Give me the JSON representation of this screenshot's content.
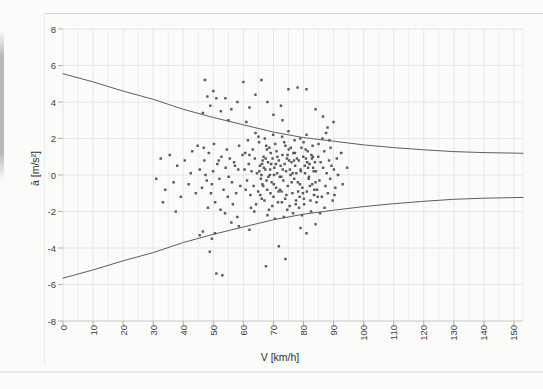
{
  "chart_data": {
    "type": "scatter",
    "title": "",
    "xlabel": "V [km/h]",
    "ylabel": "ā [m/s²]",
    "xlim": [
      0,
      153
    ],
    "ylim": [
      -8,
      8
    ],
    "x_ticks": [
      0,
      10,
      20,
      30,
      40,
      50,
      60,
      70,
      80,
      90,
      100,
      110,
      120,
      130,
      140,
      150
    ],
    "y_ticks": [
      8,
      6,
      4,
      2,
      0,
      -2,
      -4,
      -6,
      -8
    ],
    "x_minor_grid_step": 5,
    "y_grid_step": 2,
    "grid": true,
    "legend": false,
    "colors": {
      "point": "#4a4a4a",
      "curve": "#5e5e5e",
      "grid": "#ededeb",
      "grid_major": "#e6e6e4",
      "axis_line": "#c6c6c3",
      "tick_mark": "#b3b3b0",
      "tick_text": "#3f3f3f"
    },
    "series": [
      {
        "name": "measured accelerations",
        "kind": "points",
        "points": [
          [
            61.2,
            -0.3
          ],
          [
            61.8,
            0.6
          ],
          [
            62.3,
            -1.1
          ],
          [
            62.7,
            0.2
          ],
          [
            63.1,
            1.4
          ],
          [
            63.4,
            -0.6
          ],
          [
            63.8,
            0.9
          ],
          [
            64.2,
            -1.6
          ],
          [
            64.5,
            0.1
          ],
          [
            64.9,
            -0.9
          ],
          [
            65.2,
            1.8
          ],
          [
            65.5,
            0.5
          ],
          [
            65.8,
            -0.2
          ],
          [
            66.1,
            -1.3
          ],
          [
            66.4,
            0.8
          ],
          [
            60.4,
            0.3
          ],
          [
            60.8,
            -0.8
          ],
          [
            62.0,
            1.1
          ],
          [
            63.6,
            -2.0
          ],
          [
            65.0,
            2.1
          ],
          [
            61.5,
            1.9
          ],
          [
            64.0,
            2.3
          ],
          [
            62.5,
            -1.8
          ],
          [
            60.6,
            1.2
          ],
          [
            66.0,
            0.0
          ],
          [
            66.3,
            -0.5
          ],
          [
            66.7,
            1.0
          ],
          [
            67.0,
            -1.4
          ],
          [
            67.3,
            0.3
          ],
          [
            67.6,
            1.6
          ],
          [
            67.9,
            -0.8
          ],
          [
            68.2,
            0.7
          ],
          [
            68.5,
            -1.9
          ],
          [
            68.8,
            0.0
          ],
          [
            69.1,
            1.2
          ],
          [
            69.4,
            -0.4
          ],
          [
            69.7,
            0.9
          ],
          [
            70.0,
            -1.2
          ],
          [
            70.3,
            0.4
          ],
          [
            70.6,
            1.7
          ],
          [
            70.9,
            -0.7
          ],
          [
            71.2,
            0.1
          ],
          [
            71.5,
            -1.5
          ],
          [
            71.8,
            0.8
          ],
          [
            72.1,
            -0.1
          ],
          [
            67.1,
            2.0
          ],
          [
            69.9,
            2.2
          ],
          [
            68.0,
            -2.2
          ],
          [
            70.5,
            -2.4
          ],
          [
            66.8,
            0.4
          ],
          [
            69.0,
            -1.0
          ],
          [
            71.0,
            1.3
          ],
          [
            67.7,
            -0.3
          ],
          [
            70.8,
            0.6
          ],
          [
            68.6,
            1.5
          ],
          [
            72.4,
            0.5
          ],
          [
            72.7,
            -0.9
          ],
          [
            73.0,
            1.1
          ],
          [
            73.3,
            -0.3
          ],
          [
            73.6,
            1.8
          ],
          [
            73.9,
            -1.3
          ],
          [
            74.2,
            0.2
          ],
          [
            74.5,
            0.9
          ],
          [
            74.8,
            -0.6
          ],
          [
            75.1,
            1.4
          ],
          [
            75.4,
            -1.7
          ],
          [
            75.7,
            0.0
          ],
          [
            76.0,
            0.7
          ],
          [
            76.3,
            -1.0
          ],
          [
            76.6,
            1.2
          ],
          [
            76.9,
            -0.2
          ],
          [
            77.2,
            0.5
          ],
          [
            77.5,
            -1.4
          ],
          [
            77.8,
            0.9
          ],
          [
            72.9,
            2.1
          ],
          [
            75.0,
            2.4
          ],
          [
            76.5,
            -2.1
          ],
          [
            73.5,
            -2.3
          ],
          [
            74.0,
            1.6
          ],
          [
            77.0,
            1.9
          ],
          [
            75.5,
            0.3
          ],
          [
            72.6,
            -0.1
          ],
          [
            76.8,
            0.8
          ],
          [
            74.6,
            -1.9
          ],
          [
            77.6,
            0.1
          ],
          [
            78.1,
            -0.4
          ],
          [
            78.4,
            0.8
          ],
          [
            78.7,
            -1.2
          ],
          [
            79.0,
            0.3
          ],
          [
            79.3,
            1.5
          ],
          [
            79.6,
            -0.7
          ],
          [
            79.9,
            1.0
          ],
          [
            80.2,
            -1.6
          ],
          [
            80.5,
            0.1
          ],
          [
            80.8,
            0.9
          ],
          [
            81.1,
            -0.9
          ],
          [
            81.4,
            1.3
          ],
          [
            81.7,
            -0.2
          ],
          [
            82.0,
            0.6
          ],
          [
            82.3,
            -1.4
          ],
          [
            82.6,
            1.1
          ],
          [
            82.9,
            -0.5
          ],
          [
            83.2,
            0.4
          ],
          [
            83.5,
            -1.1
          ],
          [
            83.8,
            0.7
          ],
          [
            78.9,
            2.0
          ],
          [
            81.0,
            2.2
          ],
          [
            79.5,
            -2.2
          ],
          [
            82.5,
            -2.0
          ],
          [
            80.0,
            1.8
          ],
          [
            83.0,
            1.6
          ],
          [
            78.5,
            -1.8
          ],
          [
            81.8,
            -0.1
          ],
          [
            80.4,
            0.5
          ],
          [
            83.6,
            -0.8
          ],
          [
            84.1,
            0.2
          ],
          [
            84.5,
            -0.8
          ],
          [
            84.9,
            1.0
          ],
          [
            85.3,
            -0.3
          ],
          [
            85.7,
            0.7
          ],
          [
            86.1,
            -1.2
          ],
          [
            86.5,
            0.4
          ],
          [
            86.9,
            1.3
          ],
          [
            87.3,
            -0.6
          ],
          [
            87.7,
            0.1
          ],
          [
            88.1,
            -1.0
          ],
          [
            88.5,
            0.8
          ],
          [
            88.9,
            -0.2
          ],
          [
            89.3,
            0.5
          ],
          [
            89.7,
            -1.4
          ],
          [
            90.1,
            0.3
          ],
          [
            90.6,
            -0.7
          ],
          [
            91.1,
            0.9
          ],
          [
            85.0,
            1.7
          ],
          [
            87.0,
            -1.8
          ],
          [
            89.0,
            1.5
          ],
          [
            90.3,
            -1.1
          ],
          [
            86.3,
            2.0
          ],
          [
            88.6,
            1.9
          ],
          [
            84.3,
            -1.5
          ],
          [
            91.5,
            0.0
          ],
          [
            85.5,
            -2.1
          ],
          [
            87.5,
            2.3
          ],
          [
            65.3,
            0.2
          ],
          [
            66.6,
            -0.6
          ],
          [
            67.4,
            0.9
          ],
          [
            68.3,
            -0.1
          ],
          [
            69.2,
            0.6
          ],
          [
            70.1,
            -0.5
          ],
          [
            71.3,
            1.0
          ],
          [
            72.2,
            -0.8
          ],
          [
            73.1,
            0.3
          ],
          [
            74.3,
            -1.1
          ],
          [
            75.2,
            0.8
          ],
          [
            76.1,
            -0.4
          ],
          [
            77.1,
            1.2
          ],
          [
            78.2,
            -0.9
          ],
          [
            79.1,
            0.2
          ],
          [
            80.1,
            -1.3
          ],
          [
            81.2,
            0.7
          ],
          [
            82.1,
            -0.6
          ],
          [
            83.1,
            1.0
          ],
          [
            84.0,
            -0.4
          ],
          [
            65.6,
            -1.1
          ],
          [
            67.8,
            1.4
          ],
          [
            70.2,
            0.0
          ],
          [
            72.8,
            -1.5
          ],
          [
            75.8,
            1.5
          ],
          [
            78.8,
            -0.5
          ],
          [
            81.5,
            0.4
          ],
          [
            84.7,
            -1.2
          ],
          [
            68.9,
            0.3
          ],
          [
            71.7,
            -0.9
          ],
          [
            74.7,
            1.1
          ],
          [
            77.4,
            -1.6
          ],
          [
            80.7,
            1.4
          ],
          [
            83.4,
            0.2
          ],
          [
            66.2,
            0.6
          ],
          [
            69.6,
            -1.7
          ],
          [
            73.7,
            0.6
          ],
          [
            76.4,
            0.1
          ],
          [
            79.8,
            -1.0
          ],
          [
            82.8,
            0.9
          ],
          [
            45.5,
            0.3
          ],
          [
            46.2,
            -0.7
          ],
          [
            47.0,
            0.8
          ],
          [
            47.8,
            -0.3
          ],
          [
            48.5,
            1.2
          ],
          [
            49.2,
            -1.0
          ],
          [
            49.9,
            0.2
          ],
          [
            50.6,
            -1.5
          ],
          [
            51.3,
            0.6
          ],
          [
            52.0,
            -0.2
          ],
          [
            52.7,
            1.0
          ],
          [
            53.4,
            -0.8
          ],
          [
            54.1,
            0.4
          ],
          [
            54.8,
            -1.2
          ],
          [
            55.5,
            0.9
          ],
          [
            56.2,
            -0.4
          ],
          [
            56.9,
            0.7
          ],
          [
            57.6,
            -1.0
          ],
          [
            58.3,
            0.3
          ],
          [
            59.0,
            -0.6
          ],
          [
            59.7,
            1.1
          ],
          [
            46.8,
            1.5
          ],
          [
            48.2,
            -1.8
          ],
          [
            50.2,
            1.7
          ],
          [
            52.4,
            -1.9
          ],
          [
            54.5,
            1.4
          ],
          [
            56.5,
            -1.6
          ],
          [
            58.6,
            1.6
          ],
          [
            47.4,
            0.0
          ],
          [
            51.8,
            0.8
          ],
          [
            55.1,
            -0.1
          ],
          [
            57.2,
            0.5
          ],
          [
            49.5,
            -0.5
          ],
          [
            53.9,
            -2.1
          ],
          [
            58.0,
            -2.3
          ],
          [
            31.0,
            -0.2
          ],
          [
            32.5,
            0.9
          ],
          [
            34.0,
            -0.8
          ],
          [
            35.5,
            1.1
          ],
          [
            36.8,
            -0.4
          ],
          [
            38.0,
            0.5
          ],
          [
            39.2,
            -1.2
          ],
          [
            40.5,
            0.8
          ],
          [
            41.8,
            -0.5
          ],
          [
            43.0,
            1.3
          ],
          [
            44.2,
            -1.0
          ],
          [
            33.2,
            -1.5
          ],
          [
            37.5,
            -2.0
          ],
          [
            42.5,
            0.1
          ],
          [
            44.8,
            1.6
          ],
          [
            46.5,
            3.4
          ],
          [
            47.2,
            5.2
          ],
          [
            48.0,
            4.3
          ],
          [
            49.0,
            3.8
          ],
          [
            50.0,
            4.6
          ],
          [
            51.0,
            4.2
          ],
          [
            52.5,
            3.5
          ],
          [
            54.0,
            4.2
          ],
          [
            55.0,
            3.0
          ],
          [
            56.0,
            3.6
          ],
          [
            58.0,
            4.0
          ],
          [
            60.0,
            5.1
          ],
          [
            62.0,
            3.7
          ],
          [
            64.0,
            4.4
          ],
          [
            66.0,
            5.2
          ],
          [
            68.0,
            4.0
          ],
          [
            70.0,
            3.3
          ],
          [
            72.5,
            3.8
          ],
          [
            75.0,
            4.7
          ],
          [
            78.0,
            4.8
          ],
          [
            81.0,
            4.7
          ],
          [
            86.5,
            3.2
          ],
          [
            90.0,
            2.9
          ],
          [
            84.0,
            3.6
          ],
          [
            61.0,
            2.9
          ],
          [
            73.0,
            3.0
          ],
          [
            88.0,
            2.6
          ],
          [
            45.5,
            -3.3
          ],
          [
            46.5,
            -3.1
          ],
          [
            48.8,
            -4.2
          ],
          [
            50.5,
            -3.2
          ],
          [
            51.0,
            -5.4
          ],
          [
            53.0,
            -5.5
          ],
          [
            49.5,
            -3.5
          ],
          [
            56.0,
            -2.6
          ],
          [
            62.0,
            -3.0
          ],
          [
            67.5,
            -5.0
          ],
          [
            71.8,
            -3.9
          ],
          [
            81.0,
            -3.2
          ],
          [
            79.0,
            -2.9
          ],
          [
            84.0,
            -2.7
          ],
          [
            74.0,
            -4.6
          ],
          [
            58.5,
            -2.8
          ],
          [
            93.0,
            -0.5
          ],
          [
            94.5,
            0.4
          ],
          [
            92.5,
            1.2
          ]
        ]
      },
      {
        "name": "upper envelope",
        "kind": "line",
        "x": [
          0,
          10,
          20,
          30,
          40,
          50,
          60,
          70,
          80,
          90,
          100,
          110,
          120,
          130,
          140,
          150,
          153
        ],
        "y": [
          5.55,
          5.1,
          4.6,
          4.15,
          3.6,
          3.15,
          2.75,
          2.35,
          2.05,
          1.85,
          1.65,
          1.5,
          1.38,
          1.28,
          1.23,
          1.2,
          1.19
        ]
      },
      {
        "name": "lower envelope",
        "kind": "line",
        "x": [
          0,
          10,
          20,
          30,
          40,
          50,
          60,
          70,
          80,
          90,
          100,
          110,
          120,
          130,
          140,
          150,
          153
        ],
        "y": [
          -5.65,
          -5.2,
          -4.7,
          -4.25,
          -3.7,
          -3.25,
          -2.85,
          -2.45,
          -2.15,
          -1.93,
          -1.73,
          -1.57,
          -1.44,
          -1.33,
          -1.27,
          -1.24,
          -1.23
        ]
      }
    ]
  }
}
